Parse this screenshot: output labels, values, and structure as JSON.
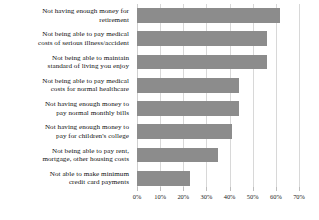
{
  "chart_data": {
    "type": "bar",
    "orientation": "horizontal",
    "title": "",
    "subtitle": "",
    "xlabel": "",
    "ylabel": "",
    "xlim": [
      0,
      70
    ],
    "grid": true,
    "legend": false,
    "bar_color": "#8c8c8c",
    "gridline_color": "#d8d8d8",
    "tick_suffix": "%",
    "xticks": [
      0,
      10,
      20,
      30,
      40,
      50,
      60,
      70
    ],
    "xtick_labels": [
      "0%",
      "10%",
      "20%",
      "30%",
      "40%",
      "50%",
      "60%",
      "70%"
    ],
    "categories": [
      "Not having enough money for retirement",
      "Not being able to pay medical costs of serious illness/accident",
      "Not being able to maintain standard of living you enjoy",
      "Not being able to pay medical costs for normal healthcare",
      "Not having enough money to pay normal monthly bills",
      "Not having enough money to pay for children's college",
      "Not being able to pay rent, mortgage, other housing costs",
      "Not able to make minimum credit card payments"
    ],
    "category_lines": [
      [
        "Not having enough money for",
        "retirement"
      ],
      [
        "Not being able to pay medical",
        "costs of serious illness/accident"
      ],
      [
        "Not being able to maintain",
        "standard of living you enjoy"
      ],
      [
        "Not being able to pay medical",
        "costs for normal healthcare"
      ],
      [
        "Not having enough money to",
        "pay normal monthly bills"
      ],
      [
        "Not having enough money to",
        "pay for children's college"
      ],
      [
        "Not being able to pay rent,",
        "mortgage, other housing costs"
      ],
      [
        "Not able to make minimum",
        "credit card payments"
      ]
    ],
    "values": [
      62,
      56,
      56,
      44,
      44,
      41,
      35,
      23
    ]
  }
}
